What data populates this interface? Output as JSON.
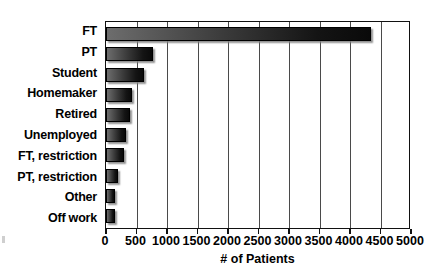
{
  "chart_data": {
    "type": "bar",
    "orientation": "horizontal",
    "title": "",
    "xlabel": "# of Patients",
    "ylabel": "",
    "categories": [
      "FT",
      "PT",
      "Student",
      "Homemaker",
      "Retired",
      "Unemployed",
      "FT, restriction",
      "PT, restriction",
      "Other",
      "Off work"
    ],
    "values": [
      4350,
      775,
      625,
      425,
      395,
      330,
      295,
      200,
      140,
      145
    ],
    "xlim": [
      0,
      5000
    ],
    "xticks": [
      0,
      500,
      1000,
      1500,
      2000,
      2500,
      3000,
      3500,
      4000,
      4500,
      5000
    ],
    "xtick_labels": [
      "0",
      "500",
      "1000",
      "1500",
      "2000",
      "2500",
      "3000",
      "3500",
      "4000",
      "4500",
      "5000"
    ],
    "grid": "vertical",
    "legend": "none",
    "bar_fill": "gradient-gray-to-black",
    "bar_gradient_start": "#6d6d6d",
    "bar_gradient_end": "#0a0a0a",
    "bar_border": "#000000",
    "frame_color": "#111111",
    "gridline_color": "#4a4a4a",
    "background": "#ffffff"
  }
}
